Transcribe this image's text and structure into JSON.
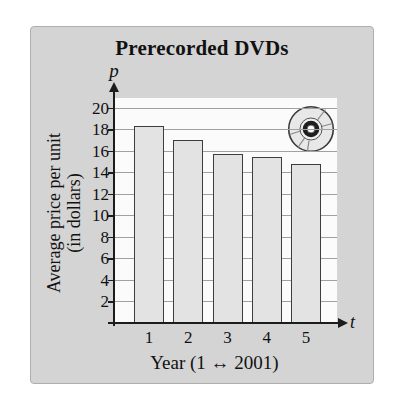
{
  "card": {
    "title": "Prerecorded DVDs"
  },
  "axes": {
    "y_symbol": "p",
    "x_symbol": "t",
    "y_title_line1": "Average price per unit",
    "y_title_line2": "(in dollars)",
    "x_title": "Year (1 ↔ 2001)"
  },
  "colors": {
    "page_bg": "#ffffff",
    "card_bg": "#d4d4d4",
    "card_border": "#aeaeae",
    "plot_bg": "#fbfbfb",
    "gridline": "#a0a0a0",
    "bar_fill": "#e3e3e3",
    "bar_border": "#3d3d3d",
    "axis": "#1c1c1c",
    "text": "#111111",
    "disc_fill": "#e8e8e8",
    "disc_hub": "#1e1e1e"
  },
  "chart_data": {
    "type": "bar",
    "title": "Prerecorded DVDs",
    "categories": [
      "1",
      "2",
      "3",
      "4",
      "5"
    ],
    "values": [
      18.4,
      17.1,
      15.8,
      15.5,
      14.9
    ],
    "xlabel": "Year (1 ↔ 2001)",
    "ylabel": "Average price per unit (in dollars)",
    "x_axis_symbol": "t",
    "y_axis_symbol": "p",
    "ylim": [
      0,
      21
    ],
    "yticks": [
      2,
      4,
      6,
      8,
      10,
      12,
      14,
      16,
      18,
      20
    ],
    "grid": true,
    "legend": "none",
    "annotation_icon": "dvd-disc-icon"
  }
}
